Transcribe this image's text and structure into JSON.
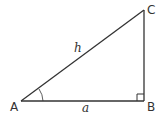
{
  "diagram": {
    "type": "right-triangle",
    "colors": {
      "line": "#333333",
      "background": "#ffffff"
    },
    "vertices": {
      "A": {
        "label": "A"
      },
      "B": {
        "label": "B"
      },
      "C": {
        "label": "C"
      }
    },
    "sides": {
      "hypotenuse": {
        "label": "h"
      },
      "adjacent": {
        "label": "a"
      }
    },
    "markers": {
      "angle_at_A": "arc",
      "right_angle_at_B": "square"
    }
  }
}
